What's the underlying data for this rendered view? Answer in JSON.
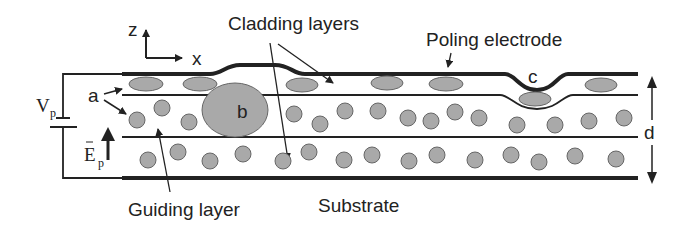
{
  "diagram": {
    "type": "cross-section schematic",
    "labels": {
      "cladding_layers": "Cladding layers",
      "poling_electrode": "Poling electrode",
      "guiding_layer": "Guiding layer",
      "substrate": "Substrate",
      "axis_z": "z",
      "axis_x": "x",
      "voltage": "V",
      "voltage_sub": "p",
      "field": "E",
      "field_sub": "p",
      "thickness": "d",
      "defect_a": "a",
      "defect_b": "b",
      "defect_c": "c"
    },
    "colors": {
      "line": "#222222",
      "particle_fill": "#a9a9a9",
      "particle_stroke": "#666666",
      "background": "#ffffff"
    },
    "layers": [
      "Poling electrode",
      "Upper cladding layer",
      "Guiding layer",
      "Lower cladding layer",
      "Substrate electrode"
    ]
  }
}
